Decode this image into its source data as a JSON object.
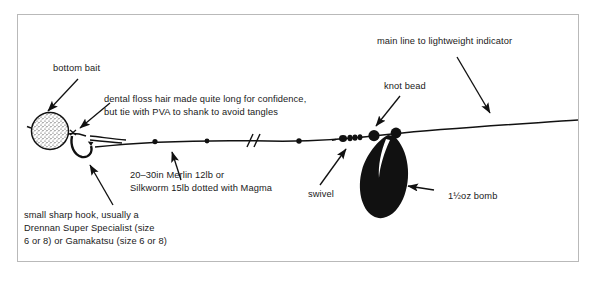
{
  "figure": {
    "frame_color": "#b9b9b9",
    "ink_color": "#111111",
    "background": "#ffffff"
  },
  "labels": {
    "bottom_bait": "bottom bait",
    "dental_floss_line1": "dental floss hair made quite long for confidence,",
    "dental_floss_line2": "but tie with PVA to shank to avoid tangles",
    "hooklink_line1": "20–30in Merlin 12lb or",
    "hooklink_line2": "Silkworm 15lb dotted with Magma",
    "hook_line1": "small sharp hook, usually a",
    "hook_line2": "Drennan Super Specialist (size",
    "hook_line3": "6 or 8) or Gamakatsu (size 6 or 8)",
    "swivel": "swivel",
    "knot_bead": "knot bead",
    "main_line": "main line to lightweight indicator",
    "bomb": "1½oz bomb"
  },
  "components": [
    {
      "name": "bottom-bait-boilie",
      "description": "stippled round boilie bait"
    },
    {
      "name": "hook",
      "description": "small sharp hook below bait"
    },
    {
      "name": "hair-rig-line",
      "description": "dental floss hair to shank"
    },
    {
      "name": "hooklink",
      "description": "20-30in Merlin 12lb hooklink"
    },
    {
      "name": "line-break-mark",
      "description": "double slash indicating shortened line"
    },
    {
      "name": "swivel",
      "description": "swivel with small beads"
    },
    {
      "name": "knot-bead",
      "description": "black knot bead"
    },
    {
      "name": "bomb-weight",
      "description": "pear shaped 1 1/2 oz bomb"
    },
    {
      "name": "main-line",
      "description": "main line running to indicator"
    }
  ]
}
